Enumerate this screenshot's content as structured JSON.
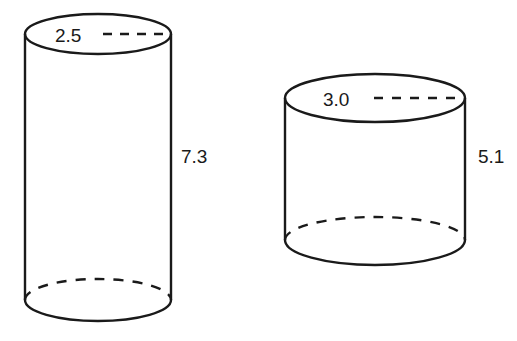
{
  "figure": {
    "stroke_color": "#1a1a1a",
    "cylinders": [
      {
        "name": "tall-cylinder",
        "radius_label": "2.5",
        "height_label": "7.3"
      },
      {
        "name": "short-cylinder",
        "radius_label": "3.0",
        "height_label": "5.1"
      }
    ]
  }
}
